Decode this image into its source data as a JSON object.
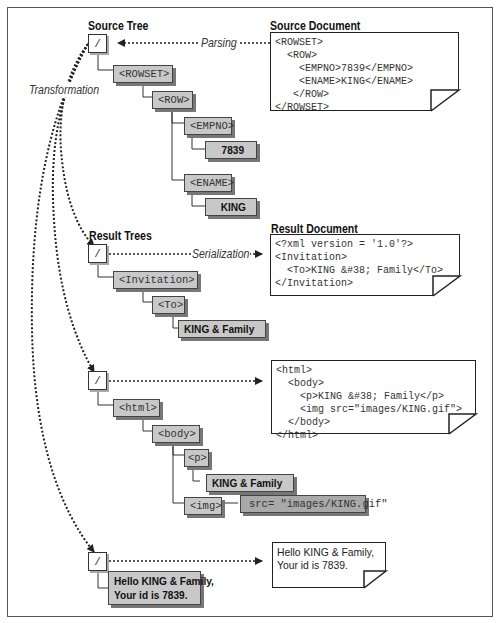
{
  "headings": {
    "source_tree": "Source Tree",
    "source_document": "Source Document",
    "result_trees": "Result Trees",
    "result_document": "Result Document"
  },
  "edge_labels": {
    "parsing": "Parsing",
    "serialization": "Serialization",
    "transformation": "Transformation"
  },
  "source_tree": {
    "root": "/",
    "nodes": [
      "<ROWSET>",
      "<ROW>",
      "<EMPNO>",
      "7839",
      "<ENAME>",
      "KING"
    ]
  },
  "source_document": {
    "lines": [
      "<ROWSET>",
      "  <ROW>",
      "    <EMPNO>7839</EMPNO>",
      "    <ENAME>KING</ENAME>",
      "   </ROW>",
      "</ROWSET>"
    ]
  },
  "result_tree_1": {
    "root": "/",
    "nodes": [
      "<Invitation>",
      "<To>",
      "KING & Family"
    ]
  },
  "result_document_1": {
    "lines": [
      "<?xml version = '1.0'?>",
      "<Invitation>",
      "  <To>KING &#38; Family</To>",
      "</Invitation>"
    ]
  },
  "result_tree_2": {
    "root": "/",
    "nodes": [
      "<html>",
      "<body>",
      "<p>",
      "KING & Family",
      "<img>",
      "src= \"images/KING.gif\""
    ]
  },
  "result_document_2": {
    "lines": [
      "<html>",
      "  <body>",
      "    <p>KING &#38; Family</p>",
      "    <img src=\"images/KING.gif\">",
      "  </body>",
      "</html>"
    ]
  },
  "result_tree_3": {
    "root": "/",
    "nodes": [
      "Hello KING & Family,\nYour id is 7839."
    ]
  },
  "result_document_3": {
    "lines": [
      "Hello KING & Family,",
      "Your id is 7839."
    ]
  }
}
